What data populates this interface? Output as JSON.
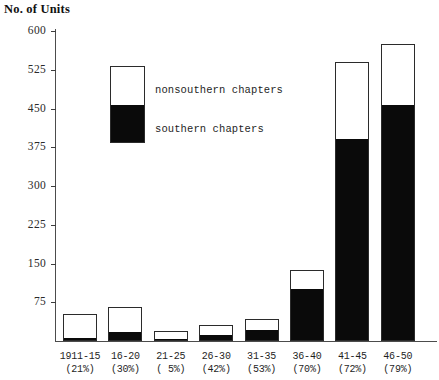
{
  "chart_data": {
    "type": "bar",
    "title": "No. of Units",
    "ylabel": "No. of Units",
    "xlabel": "",
    "stacked": true,
    "grid": false,
    "legend_position": "inside-upper-left",
    "ylim": [
      0,
      600
    ],
    "yticks": [
      75,
      150,
      225,
      300,
      375,
      450,
      525,
      600
    ],
    "ytick_labels": [
      "75",
      "150",
      "225",
      "300",
      "375",
      "450",
      "525",
      "600"
    ],
    "categories": [
      "1911-15",
      "16-20",
      "21-25",
      "26-30",
      "31-35",
      "36-40",
      "41-45",
      "46-50"
    ],
    "category_sublabels": [
      "(21%)",
      "(30%)",
      "( 5%)",
      "(42%)",
      "(53%)",
      "(70%)",
      "(72%)",
      "(79%)"
    ],
    "series": [
      {
        "name": "southern chapters",
        "color": "#0a0a0a",
        "values": [
          4,
          16,
          1,
          9,
          19,
          98,
          390,
          455
        ]
      },
      {
        "name": "nonsouthern chapters",
        "color": "#ffffff",
        "values": [
          48,
          49,
          18,
          22,
          23,
          39,
          150,
          120
        ]
      }
    ],
    "totals": [
      52,
      65,
      19,
      31,
      42,
      137,
      540,
      575
    ]
  },
  "axis": {
    "title": "No. of Units"
  },
  "legend": {
    "top_label": "nonsouthern chapters",
    "bottom_label": "southern chapters"
  }
}
